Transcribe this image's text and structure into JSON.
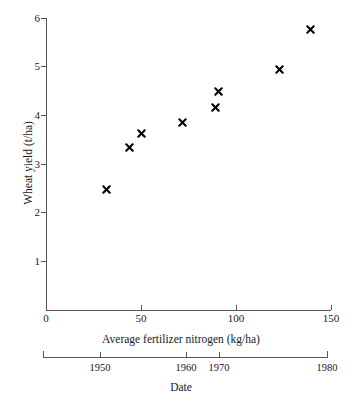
{
  "chart_data": {
    "type": "scatter",
    "title": "",
    "xlabel": "Average fertilizer nitrogen (kg/ha)",
    "ylabel": "Wheat yield (t/ha)",
    "secondary_xlabel": "Date",
    "xlim": [
      0,
      150
    ],
    "ylim": [
      0,
      6
    ],
    "grid": false,
    "legend": null,
    "marker": "x",
    "marker_color": "#000000",
    "x_ticks": [
      0,
      50,
      100,
      150
    ],
    "x_ticklabels": [
      "0",
      "50",
      "100",
      "150"
    ],
    "y_ticks": [
      1,
      2,
      3,
      4,
      5,
      6
    ],
    "y_ticklabels": [
      "1",
      "2",
      "3",
      "4",
      "5",
      "6"
    ],
    "secondary_x_ticks": [
      1950,
      1960,
      1970,
      1980
    ],
    "secondary_x_ticklabels": [
      "1950",
      "1960",
      "1970",
      "1980"
    ],
    "secondary_x_tick_nitrogen": [
      30,
      74,
      91,
      148
    ],
    "x": [
      32,
      44,
      50,
      72,
      89,
      91,
      123,
      139
    ],
    "y": [
      2.48,
      3.34,
      3.63,
      3.84,
      4.15,
      4.48,
      4.95,
      5.77
    ],
    "points": [
      {
        "x": 32,
        "y": 2.48
      },
      {
        "x": 44,
        "y": 3.34
      },
      {
        "x": 50,
        "y": 3.63
      },
      {
        "x": 72,
        "y": 3.84
      },
      {
        "x": 89,
        "y": 4.15
      },
      {
        "x": 91,
        "y": 4.48
      },
      {
        "x": 123,
        "y": 4.95
      },
      {
        "x": 139,
        "y": 5.77
      }
    ]
  },
  "axis_colors": {
    "axis_line": "#555555",
    "text": "#1a1a1a",
    "background": "#ffffff"
  }
}
